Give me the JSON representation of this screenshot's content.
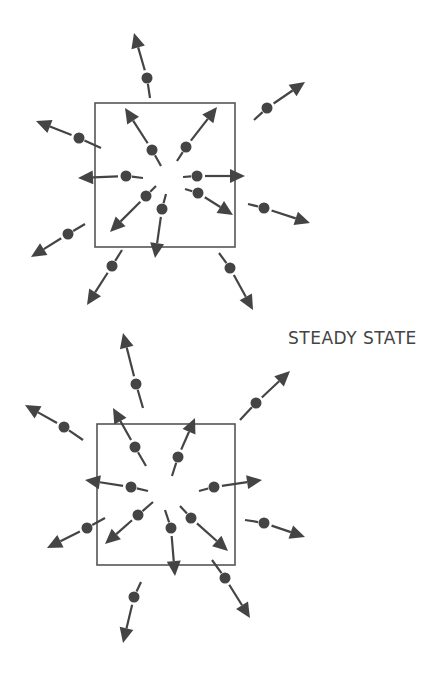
{
  "figure": {
    "label": "STEADY STATE",
    "colors": {
      "ink": "#444444",
      "box": "#555555",
      "background": "#ffffff"
    },
    "diagrams": [
      {
        "name": "top-diagram",
        "box": {
          "x": 95,
          "y": 103,
          "w": 140,
          "h": 144
        },
        "particles": [
          {
            "name": "outer-n",
            "dash": [
              150,
              98
            ],
            "dot": [
              147,
              78
            ],
            "tip": [
              134,
              33
            ]
          },
          {
            "name": "outer-ne",
            "dash": [
              254,
              120
            ],
            "dot": [
              267,
              108
            ],
            "tip": [
              305,
              82
            ]
          },
          {
            "name": "outer-w",
            "dash": [
              101,
              148
            ],
            "dot": [
              79,
              138
            ],
            "tip": [
              36,
              121
            ]
          },
          {
            "name": "outer-e",
            "dash": [
              248,
              204
            ],
            "dot": [
              264,
              208
            ],
            "tip": [
              310,
              223
            ]
          },
          {
            "name": "outer-sw",
            "dash": [
              85,
              224
            ],
            "dot": [
              68,
              234
            ],
            "tip": [
              31,
              257
            ]
          },
          {
            "name": "outer-s",
            "dash": [
              122,
              250
            ],
            "dot": [
              112,
              266
            ],
            "tip": [
              87,
              305
            ]
          },
          {
            "name": "outer-se",
            "dash": [
              219,
              253
            ],
            "dot": [
              230,
              268
            ],
            "tip": [
              253,
              310
            ]
          },
          {
            "name": "inner-nw",
            "dash": [
              161,
              166
            ],
            "dot": [
              152,
              150
            ],
            "tip": [
              125,
              108
            ]
          },
          {
            "name": "inner-ne",
            "dash": [
              177,
              161
            ],
            "dot": [
              186,
              147
            ],
            "tip": [
              217,
              107
            ]
          },
          {
            "name": "inner-w",
            "dash": [
              143,
              178
            ],
            "dot": [
              126,
              176
            ],
            "tip": [
              78,
              178
            ]
          },
          {
            "name": "inner-e",
            "dash": [
              183,
              177
            ],
            "dot": [
              197,
              176
            ],
            "tip": [
              245,
              176
            ]
          },
          {
            "name": "inner-sw",
            "dash": [
              156,
              186
            ],
            "dot": [
              146,
              196
            ],
            "tip": [
              110,
              232
            ]
          },
          {
            "name": "inner-s",
            "dash": [
              166,
              194
            ],
            "dot": [
              162,
              209
            ],
            "tip": [
              155,
              258
            ]
          },
          {
            "name": "inner-se",
            "dash": [
              185,
              189
            ],
            "dot": [
              198,
              193
            ],
            "tip": [
              233,
              215
            ]
          }
        ]
      },
      {
        "name": "bottom-diagram",
        "box": {
          "x": 97,
          "y": 424,
          "w": 138,
          "h": 141
        },
        "particles": [
          {
            "name": "outer-n",
            "dash": [
              143,
              408
            ],
            "dot": [
              136,
              384
            ],
            "tip": [
              123,
              333
            ]
          },
          {
            "name": "outer-ne",
            "dash": [
              240,
              420
            ],
            "dot": [
              256,
              403
            ],
            "tip": [
              290,
              371
            ]
          },
          {
            "name": "outer-w",
            "dash": [
              83,
              440
            ],
            "dot": [
              64,
              427
            ],
            "tip": [
              25,
              405
            ]
          },
          {
            "name": "outer-e",
            "dash": [
              245,
              520
            ],
            "dot": [
              264,
              523
            ],
            "tip": [
              305,
              537
            ]
          },
          {
            "name": "outer-sw",
            "dash": [
              105,
              518
            ],
            "dot": [
              87,
              528
            ],
            "tip": [
              47,
              548
            ]
          },
          {
            "name": "outer-s",
            "dash": [
              141,
              582
            ],
            "dot": [
              134,
              597
            ],
            "tip": [
              123,
              643
            ]
          },
          {
            "name": "outer-se",
            "dash": [
              212,
              560
            ],
            "dot": [
              225,
              578
            ],
            "tip": [
              250,
              618
            ]
          },
          {
            "name": "inner-nw",
            "dash": [
              146,
              466
            ],
            "dot": [
              135,
              447
            ],
            "tip": [
              113,
              408
            ]
          },
          {
            "name": "inner-ne",
            "dash": [
              172,
              476
            ],
            "dot": [
              178,
              457
            ],
            "tip": [
              195,
              418
            ]
          },
          {
            "name": "inner-w",
            "dash": [
              148,
              491
            ],
            "dot": [
              131,
              487
            ],
            "tip": [
              85,
              480
            ]
          },
          {
            "name": "inner-e",
            "dash": [
              199,
              491
            ],
            "dot": [
              214,
              487
            ],
            "tip": [
              262,
              480
            ]
          },
          {
            "name": "inner-sw",
            "dash": [
              153,
              502
            ],
            "dot": [
              138,
              515
            ],
            "tip": [
              105,
              544
            ]
          },
          {
            "name": "inner-s",
            "dash": [
              165,
              510
            ],
            "dot": [
              171,
              528
            ],
            "tip": [
              175,
              576
            ]
          },
          {
            "name": "inner-se",
            "dash": [
              180,
              506
            ],
            "dot": [
              191,
              518
            ],
            "tip": [
              228,
              551
            ]
          }
        ]
      }
    ]
  }
}
